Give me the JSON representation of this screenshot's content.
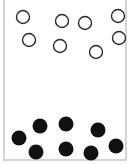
{
  "diagram": {
    "colors": {
      "open_stroke": "#2a2a2a",
      "filled": "#111111",
      "frame": "#d4d4d4",
      "background": "#ffffff"
    },
    "radius": 7,
    "open_circles": [
      {
        "x": 23,
        "y": 17
      },
      {
        "x": 62,
        "y": 21
      },
      {
        "x": 85,
        "y": 23
      },
      {
        "x": 118,
        "y": 16
      },
      {
        "x": 29,
        "y": 40
      },
      {
        "x": 60,
        "y": 46
      },
      {
        "x": 96,
        "y": 52
      },
      {
        "x": 119,
        "y": 38
      }
    ],
    "filled_circles": [
      {
        "x": 19,
        "y": 138
      },
      {
        "x": 40,
        "y": 126
      },
      {
        "x": 66,
        "y": 124
      },
      {
        "x": 98,
        "y": 130
      },
      {
        "x": 36,
        "y": 152
      },
      {
        "x": 66,
        "y": 149
      },
      {
        "x": 91,
        "y": 153
      },
      {
        "x": 116,
        "y": 146
      }
    ]
  }
}
